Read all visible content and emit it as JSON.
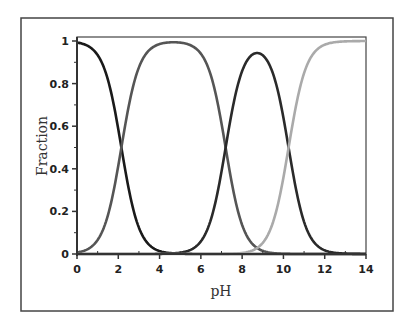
{
  "chart_data": {
    "type": "line",
    "title": "",
    "xlabel": "pH",
    "ylabel": "Fraction",
    "xlim": [
      0,
      14
    ],
    "ylim": [
      0,
      1
    ],
    "xticks": [
      0,
      2,
      4,
      6,
      8,
      10,
      12,
      14
    ],
    "xtick_labels": [
      "0",
      "2",
      "4",
      "6",
      "8",
      "10",
      "12",
      "14"
    ],
    "yticks": [
      0,
      0.2,
      0.4,
      0.6,
      0.8,
      1
    ],
    "ytick_labels": [
      "0",
      "0.2",
      "0.4",
      "0.6",
      "0.8",
      "1"
    ],
    "grid": false,
    "legend": null,
    "pKa": [
      2.15,
      7.2,
      10.25
    ],
    "series": [
      {
        "name": "H3A",
        "color": "#1a1a1a",
        "x": [
          0,
          1,
          2,
          2.15,
          3,
          4,
          5,
          6,
          7,
          8
        ],
        "values": [
          0.99,
          0.93,
          0.59,
          0.5,
          0.12,
          0.01,
          0.0,
          0.0,
          0.0,
          0.0
        ]
      },
      {
        "name": "H2A-",
        "color": "#555555",
        "x": [
          0,
          1,
          2,
          2.15,
          3,
          4,
          4.7,
          5,
          6,
          7,
          7.2,
          8,
          9
        ],
        "values": [
          0.01,
          0.07,
          0.41,
          0.5,
          0.87,
          0.98,
          0.99,
          0.99,
          0.94,
          0.61,
          0.5,
          0.14,
          0.02
        ]
      },
      {
        "name": "HA2-",
        "color": "#2a2a2a",
        "x": [
          5,
          6,
          7,
          7.2,
          8,
          8.7,
          9,
          10,
          10.25,
          11,
          12
        ],
        "values": [
          0.01,
          0.06,
          0.39,
          0.5,
          0.86,
          0.96,
          0.94,
          0.64,
          0.5,
          0.15,
          0.02
        ]
      },
      {
        "name": "A3-",
        "color": "#aaaaaa",
        "x": [
          8,
          9,
          10,
          10.25,
          11,
          12,
          13,
          14
        ],
        "values": [
          0.0,
          0.05,
          0.36,
          0.5,
          0.85,
          0.98,
          1.0,
          1.0
        ]
      }
    ]
  }
}
